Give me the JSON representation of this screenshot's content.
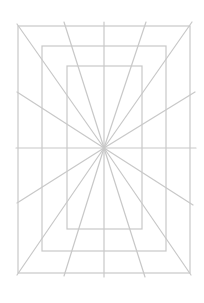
{
  "diagram": {
    "background": "#ffffff",
    "stroke_color": "#c8c8c8",
    "stroke_width": 1.2,
    "center": {
      "x": 104,
      "y": 148
    },
    "rectangles": [
      {
        "name": "outer",
        "x": 18,
        "y": 26,
        "w": 172,
        "h": 247
      },
      {
        "name": "middle",
        "x": 42,
        "y": 46,
        "w": 124,
        "h": 205
      },
      {
        "name": "inner",
        "x": 67,
        "y": 66,
        "w": 75,
        "h": 163
      }
    ],
    "axis_lines": [
      {
        "name": "vertical",
        "x1": 104,
        "y1": 22,
        "x2": 104,
        "y2": 277
      },
      {
        "name": "horizontal",
        "x1": 16,
        "y1": 148,
        "x2": 196,
        "y2": 148
      }
    ],
    "rays": [
      {
        "name": "top-left-corner",
        "x": 17,
        "y": 24
      },
      {
        "name": "top-left",
        "x": 64,
        "y": 22
      },
      {
        "name": "top-right",
        "x": 146,
        "y": 22
      },
      {
        "name": "top-right-corner",
        "x": 192,
        "y": 22
      },
      {
        "name": "right-upper",
        "x": 195,
        "y": 92
      },
      {
        "name": "right-lower",
        "x": 193,
        "y": 205
      },
      {
        "name": "bottom-right-corner",
        "x": 191,
        "y": 275
      },
      {
        "name": "bottom-right",
        "x": 145,
        "y": 277
      },
      {
        "name": "bottom-left",
        "x": 64,
        "y": 276
      },
      {
        "name": "bottom-left-corner",
        "x": 17,
        "y": 275
      },
      {
        "name": "left-lower",
        "x": 17,
        "y": 203
      },
      {
        "name": "left-upper",
        "x": 17,
        "y": 92
      }
    ]
  }
}
